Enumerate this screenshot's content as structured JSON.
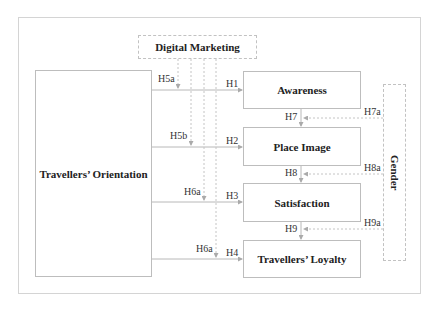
{
  "diagram": {
    "nodes": {
      "digital_marketing": "Digital Marketing",
      "travellers_orientation": "Travellers’ Orientation",
      "awareness": "Awareness",
      "place_image": "Place Image",
      "satisfaction": "Satisfaction",
      "travellers_loyalty": "Travellers’ Loyalty",
      "gender": "Gender"
    },
    "hypotheses": {
      "h1": "H1",
      "h2": "H2",
      "h3": "H3",
      "h4": "H4",
      "h5a": "H5a",
      "h5b": "H5b",
      "h6a_1": "H6a",
      "h6a_2": "H6a",
      "h7": "H7",
      "h8": "H8",
      "h9": "H9",
      "h7a": "H7a",
      "h8a": "H8a",
      "h9a": "H9a"
    },
    "colors": {
      "line": "#b8b8b8",
      "text": "#222222"
    }
  }
}
